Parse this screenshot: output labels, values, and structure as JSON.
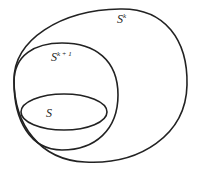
{
  "diagram": {
    "type": "nested-sets",
    "sets": [
      {
        "id": "outer",
        "label": "S",
        "superscript": "k"
      },
      {
        "id": "middle",
        "label": "S",
        "superscript": "k + 1"
      },
      {
        "id": "inner",
        "label": "S",
        "superscript": ""
      }
    ],
    "stroke_color": "#222222"
  }
}
